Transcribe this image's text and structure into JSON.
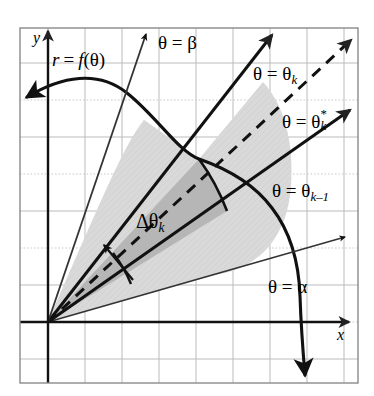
{
  "figure": {
    "kind": "polar-area-element-diagram",
    "background_color": "#ffffff",
    "frame_color": "#888888",
    "grid_color": "#b9b9b9",
    "grid_dotted_color": "#c9c9c9",
    "curve_color": "#111111",
    "ray_color": "#111111",
    "shade_light": "#d9d9d9",
    "shade_dark": "#b6b6b6",
    "frame": {
      "x": 20,
      "y": 28,
      "width": 338,
      "height": 355
    },
    "grid_spacing": 37,
    "origin": {
      "x": 48,
      "y": 322
    }
  },
  "axes": {
    "x_label": "x",
    "y_label": "y",
    "x_axis_y": 322,
    "y_axis_x": 48
  },
  "curve": {
    "label": "r = f(θ)",
    "label_r": "r",
    "label_eq": "=",
    "label_f": "f",
    "label_theta": "(θ)",
    "has_start_arrow": true,
    "has_end_arrow": true
  },
  "rays": [
    {
      "name": "alpha",
      "label": "θ = α",
      "label_lhs": "θ =",
      "label_rhs": "α",
      "angle_deg": 16,
      "dashed": false,
      "weight": "thin"
    },
    {
      "name": "theta-k-1",
      "label": "θ = θk−1",
      "label_lhs": "θ =",
      "label_rhs": "θ",
      "subscript": "k–1",
      "angle_deg": 35,
      "dashed": false,
      "weight": "thick"
    },
    {
      "name": "theta-k-star",
      "label": "θ = θk*",
      "label_lhs": "θ =",
      "label_rhs": "θ",
      "superscript": "*",
      "subscript": "k",
      "angle_deg": 43,
      "dashed": true,
      "weight": "thick"
    },
    {
      "name": "theta-k",
      "label": "θ = θk",
      "label_lhs": "θ =",
      "label_rhs": "θ",
      "subscript": "k",
      "angle_deg": 51,
      "dashed": false,
      "weight": "thick"
    },
    {
      "name": "beta",
      "label": "θ = β",
      "label_lhs": "θ =",
      "label_rhs": "β",
      "angle_deg": 72,
      "dashed": false,
      "weight": "thin"
    }
  ],
  "annotations": {
    "delta_theta": {
      "label": "Δθ",
      "subscript": "k",
      "arrow": "double-headed"
    }
  }
}
